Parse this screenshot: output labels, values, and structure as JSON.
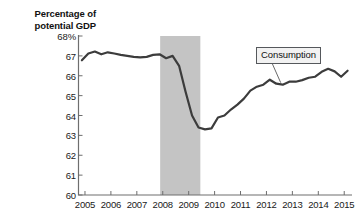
{
  "chart_data": {
    "type": "line",
    "title": "",
    "ylabel": "Percentage of potential GDP",
    "xlabel": "",
    "ylim": [
      60,
      68
    ],
    "xlim": [
      2004.75,
      2015.3
    ],
    "yticks": [
      60,
      61,
      62,
      63,
      64,
      65,
      66,
      67,
      68
    ],
    "yticklabels": [
      "60",
      "61",
      "62",
      "63",
      "64",
      "65",
      "66",
      "67",
      "68%"
    ],
    "xticks": [
      2005,
      2006,
      2007,
      2008,
      2009,
      2010,
      2011,
      2012,
      2013,
      2014,
      2015
    ],
    "xticklabels": [
      "2005",
      "2006",
      "2007",
      "2008",
      "2009",
      "2010",
      "2011",
      "2012",
      "2013",
      "2014",
      "2015"
    ],
    "grid": false,
    "legend_position": "inline-callout",
    "series": [
      {
        "name": "Consumption",
        "color": "#3c3c3c",
        "x": [
          2004.88,
          2005.13,
          2005.38,
          2005.63,
          2005.88,
          2006.13,
          2006.38,
          2006.63,
          2006.88,
          2007.13,
          2007.38,
          2007.63,
          2007.88,
          2008.13,
          2008.38,
          2008.63,
          2008.88,
          2009.13,
          2009.38,
          2009.63,
          2009.88,
          2010.13,
          2010.38,
          2010.63,
          2010.88,
          2011.13,
          2011.38,
          2011.63,
          2011.88,
          2012.13,
          2012.38,
          2012.63,
          2012.88,
          2013.13,
          2013.38,
          2013.63,
          2013.88,
          2014.13,
          2014.38,
          2014.63,
          2014.88,
          2015.13
        ],
        "y": [
          66.78,
          67.12,
          67.22,
          67.08,
          67.18,
          67.12,
          67.05,
          67.0,
          66.95,
          66.92,
          66.95,
          67.05,
          67.08,
          66.88,
          67.0,
          66.5,
          65.2,
          64.0,
          63.4,
          63.3,
          63.35,
          63.9,
          64.0,
          64.3,
          64.55,
          64.85,
          65.25,
          65.45,
          65.55,
          65.8,
          65.6,
          65.55,
          65.7,
          65.7,
          65.78,
          65.9,
          65.95,
          66.2,
          66.35,
          66.22,
          65.95,
          66.25
        ]
      }
    ],
    "shaded_regions": [
      {
        "name": "recession",
        "x_start": 2007.9,
        "x_end": 2009.45,
        "color": "#c4c4c4"
      }
    ],
    "annotations": [
      {
        "name": "Consumption",
        "label": "Consumption",
        "point_x": 2012.55,
        "point_y": 65.55
      }
    ]
  },
  "chart": {
    "ytitle_line1": "Percentage of",
    "ytitle_line2": "potential GDP"
  }
}
